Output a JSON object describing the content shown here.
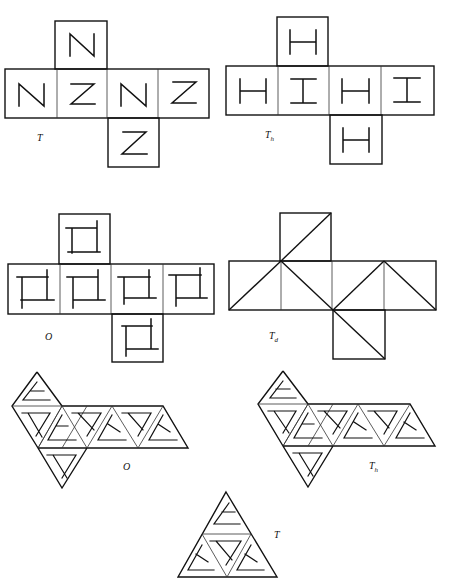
{
  "figure": {
    "nets": [
      {
        "id": "cube-T",
        "shape": "cube",
        "group_label": "T",
        "group_sub": "",
        "faces": [
          "N",
          "N",
          "Z",
          "N",
          "Z",
          "Z"
        ],
        "motif": "letter N / Z"
      },
      {
        "id": "cube-Th",
        "shape": "cube",
        "group_label": "T",
        "group_sub": "h",
        "faces": [
          "H",
          "H",
          "I",
          "H",
          "I",
          "H"
        ],
        "motif": "letter H / I"
      },
      {
        "id": "cube-O",
        "shape": "cube",
        "group_label": "O",
        "group_sub": "",
        "faces": [
          "pinwheel",
          "pinwheel",
          "pinwheel",
          "pinwheel",
          "pinwheel",
          "pinwheel"
        ],
        "motif": "square pinwheel"
      },
      {
        "id": "cube-Td",
        "shape": "cube",
        "group_label": "T",
        "group_sub": "d",
        "faces": [
          "diagonal",
          "diagonal",
          "diagonal",
          "diagonal",
          "diagonal",
          "diagonal"
        ],
        "motif": "diagonal lines"
      },
      {
        "id": "octa-O",
        "shape": "octahedron",
        "group_label": "O",
        "group_sub": "",
        "motif": "triangle pinwheel"
      },
      {
        "id": "octa-Th",
        "shape": "octahedron",
        "group_label": "T",
        "group_sub": "h",
        "motif": "triangle pinwheel"
      },
      {
        "id": "tetra-T",
        "shape": "tetrahedron",
        "group_label": "T",
        "group_sub": "",
        "motif": "triangle pinwheel"
      }
    ]
  },
  "labels": {
    "cube_T": "T",
    "cube_Th_main": "T",
    "cube_Th_sub": "h",
    "cube_O": "O",
    "cube_Td_main": "T",
    "cube_Td_sub": "d",
    "octa_O": "O",
    "octa_Th_main": "T",
    "octa_Th_sub": "h",
    "tetra_T": "T"
  }
}
